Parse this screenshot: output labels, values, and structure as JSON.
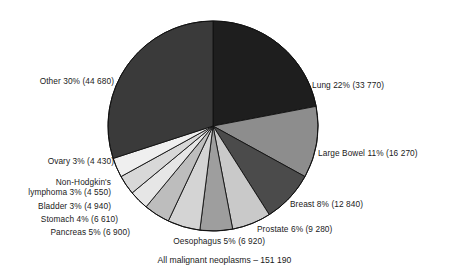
{
  "chart_data": {
    "type": "pie",
    "title": "",
    "caption": "All malignant neoplasms – 151 190",
    "total": 151190,
    "start_angle_deg": 0,
    "direction": "clockwise",
    "legend": "none (direct labels)",
    "grid": false,
    "categories": [
      "Lung",
      "Large Bowel",
      "Breast",
      "Prostate",
      "Oesophagus",
      "Pancreas",
      "Stomach",
      "Bladder",
      "Non-Hodgkin's lymphoma",
      "Ovary",
      "Other"
    ],
    "values": [
      33770,
      16270,
      12840,
      9280,
      6920,
      6900,
      6610,
      4940,
      4550,
      4430,
      44680
    ],
    "percents": [
      22,
      11,
      8,
      6,
      5,
      5,
      4,
      3,
      3,
      3,
      30
    ],
    "slices": [
      {
        "name": "Lung",
        "percent": 22,
        "count": 33770,
        "label": "Lung 22% (33 770)",
        "color": "#1e1e1e"
      },
      {
        "name": "Large Bowel",
        "percent": 11,
        "count": 16270,
        "label": "Large Bowel 11% (16 270)",
        "color": "#8d8d8d"
      },
      {
        "name": "Breast",
        "percent": 8,
        "count": 12840,
        "label": "Breast 8% (12 840)",
        "color": "#4b4b4b"
      },
      {
        "name": "Prostate",
        "percent": 6,
        "count": 9280,
        "label": "Prostate 6% (9 280)",
        "color": "#c9c9c9"
      },
      {
        "name": "Oesophagus",
        "percent": 5,
        "count": 6920,
        "label": "Oesophagus 5% (6 920)",
        "color": "#9e9e9e"
      },
      {
        "name": "Pancreas",
        "percent": 5,
        "count": 6900,
        "label": "Pancreas 5% (6 900)",
        "color": "#d4d4d4"
      },
      {
        "name": "Stomach",
        "percent": 4,
        "count": 6610,
        "label": "Stomach 4% (6 610)",
        "color": "#bdbdbd"
      },
      {
        "name": "Bladder",
        "percent": 3,
        "count": 4940,
        "label": "Bladder 3% (4 940)",
        "color": "#e6e6e6"
      },
      {
        "name": "Non-Hodgkin's lymphoma",
        "percent": 3,
        "count": 4550,
        "label_line1": "Non-Hodgkin's",
        "label_line2": "lymphoma 3% (4 550)",
        "color": "#d8d8d8"
      },
      {
        "name": "Ovary",
        "percent": 3,
        "count": 4430,
        "label": "Ovary 3% (4 430)",
        "color": "#efefef"
      },
      {
        "name": "Other",
        "percent": 30,
        "count": 44680,
        "label": "Other 30% (44 680)",
        "color": "#3a3a3a"
      }
    ],
    "geometry": {
      "center_x": 213,
      "center_y": 126,
      "radius": 105,
      "outline_color": "#111111"
    }
  }
}
